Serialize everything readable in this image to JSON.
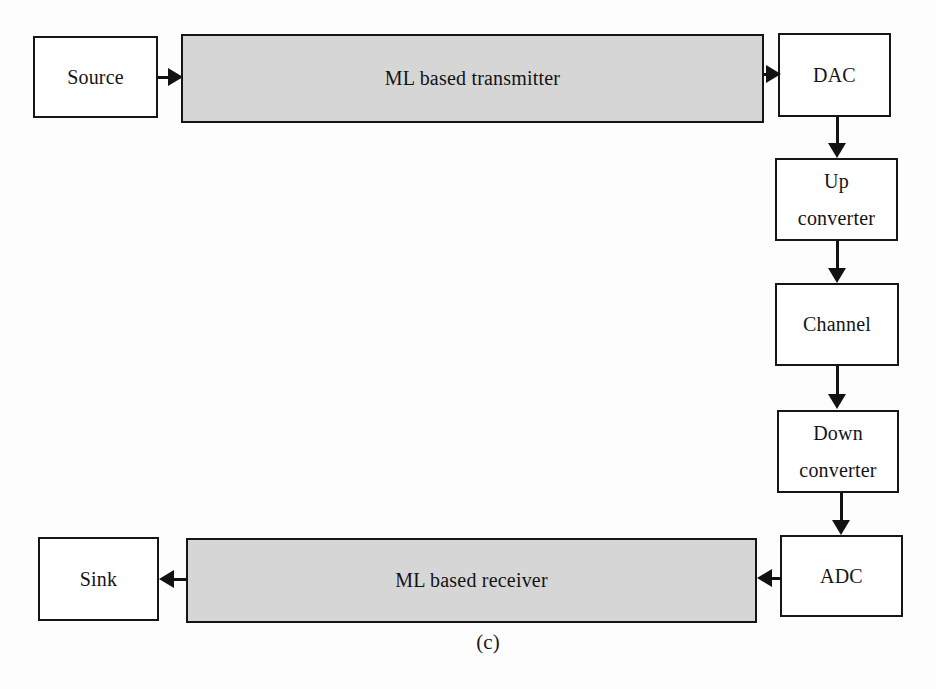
{
  "figure": {
    "caption": "(c)",
    "colors": {
      "shaded_block_fill": "#d6d6d6",
      "block_border": "#161616",
      "background": "#fdfdfd",
      "connector": "#121212"
    },
    "nodes": [
      {
        "id": "source",
        "label": "Source",
        "style": "plain"
      },
      {
        "id": "transmitter",
        "label": "ML based transmitter",
        "style": "shaded"
      },
      {
        "id": "dac",
        "label": "DAC",
        "style": "plain"
      },
      {
        "id": "upconverter",
        "line1": "Up",
        "line2": "converter",
        "style": "plain"
      },
      {
        "id": "channel",
        "label": "Channel",
        "style": "plain"
      },
      {
        "id": "downconverter",
        "line1": "Down",
        "line2": "converter",
        "style": "plain"
      },
      {
        "id": "adc",
        "label": "ADC",
        "style": "plain"
      },
      {
        "id": "receiver",
        "label": "ML based receiver",
        "style": "shaded"
      },
      {
        "id": "sink",
        "label": "Sink",
        "style": "plain"
      }
    ],
    "connections": [
      {
        "from": "source",
        "to": "transmitter",
        "direction": "right"
      },
      {
        "from": "transmitter",
        "to": "dac",
        "direction": "right"
      },
      {
        "from": "dac",
        "to": "upconverter",
        "direction": "down"
      },
      {
        "from": "upconverter",
        "to": "channel",
        "direction": "down"
      },
      {
        "from": "channel",
        "to": "downconverter",
        "direction": "down"
      },
      {
        "from": "downconverter",
        "to": "adc",
        "direction": "down"
      },
      {
        "from": "adc",
        "to": "receiver",
        "direction": "left"
      },
      {
        "from": "receiver",
        "to": "sink",
        "direction": "left"
      }
    ]
  }
}
